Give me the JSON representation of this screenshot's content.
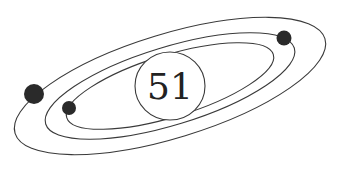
{
  "diagram": {
    "center_label": "51",
    "elements": {
      "orbits": [
        "outer-orbit",
        "middle-orbit",
        "inner-orbit"
      ],
      "planets": [
        "large-planet",
        "small-planet",
        "medium-planet"
      ]
    },
    "colors": {
      "stroke": "#3a3a3a",
      "planet": "#2a2a2a",
      "background": "#ffffff"
    }
  }
}
